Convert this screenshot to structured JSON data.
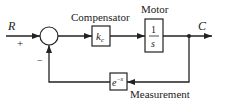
{
  "diagram": {
    "type": "block-diagram",
    "input_label": "R",
    "output_label": "C",
    "sum_signs": {
      "input": "+",
      "feedback": "−"
    },
    "blocks": [
      {
        "id": "compensator",
        "title": "Compensator",
        "content": "k",
        "subscript": "c"
      },
      {
        "id": "motor",
        "title": "Motor",
        "numerator": "1",
        "denominator": "s"
      },
      {
        "id": "measurement",
        "title": "Measurement",
        "content": "e",
        "superscript": "−x"
      }
    ]
  }
}
